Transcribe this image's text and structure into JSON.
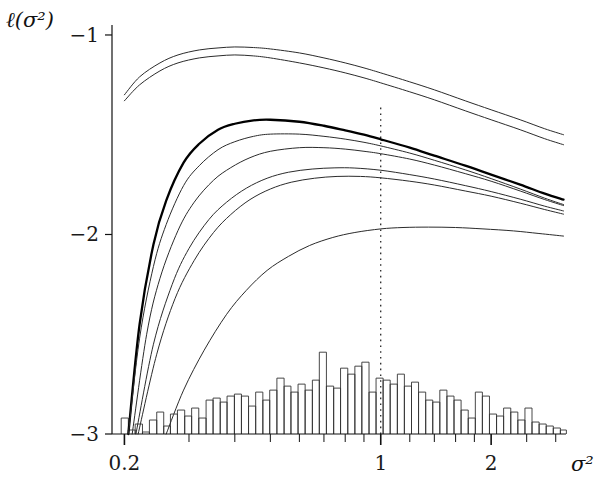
{
  "chart_data": {
    "type": "line",
    "title": "",
    "subtitle": "",
    "xlabel": "σ²",
    "ylabel": "ℓ(σ²)",
    "xscale": "log",
    "yscale": "linear",
    "xlim": [
      0.185,
      3.2
    ],
    "ylim": [
      -3.0,
      -0.95
    ],
    "grid": false,
    "legend": "none",
    "x_ticks_labeled": [
      {
        "value": 0.2,
        "label": "0.2"
      },
      {
        "value": 1.0,
        "label": "1"
      },
      {
        "value": 2.0,
        "label": "2"
      }
    ],
    "x_minor_ticks": [
      0.3,
      0.4,
      0.5,
      0.6,
      0.7,
      0.8,
      0.9,
      1.2,
      1.4,
      1.6,
      1.8,
      2.5,
      3.0
    ],
    "y_ticks_labeled": [
      {
        "value": -1,
        "label": "−1"
      },
      {
        "value": -2,
        "label": "−2"
      },
      {
        "value": -3,
        "label": "−3"
      }
    ],
    "annotations": [
      {
        "name": "reference-line-sigma-one",
        "type": "vline",
        "x": 1.0,
        "style": "dotted",
        "y_from": -3.0,
        "y_to": -1.35
      }
    ],
    "series": [
      {
        "name": "curve-1-upper-a",
        "style": "thin",
        "linewidth": 1.0,
        "color": "#2b2b2b",
        "x": [
          0.2,
          0.22,
          0.25,
          0.28,
          0.32,
          0.36,
          0.4,
          0.45,
          0.5,
          0.6,
          0.7,
          0.8,
          0.9,
          1.0,
          1.2,
          1.4,
          1.7,
          2.0,
          2.4,
          2.8,
          3.15
        ],
        "y": [
          -1.3,
          -1.21,
          -1.14,
          -1.1,
          -1.075,
          -1.065,
          -1.06,
          -1.063,
          -1.07,
          -1.09,
          -1.115,
          -1.14,
          -1.165,
          -1.19,
          -1.235,
          -1.275,
          -1.33,
          -1.375,
          -1.425,
          -1.47,
          -1.5
        ]
      },
      {
        "name": "curve-2-upper-b",
        "style": "thin",
        "linewidth": 1.0,
        "color": "#2b2b2b",
        "x": [
          0.2,
          0.22,
          0.25,
          0.28,
          0.32,
          0.36,
          0.4,
          0.45,
          0.5,
          0.6,
          0.7,
          0.8,
          0.9,
          1.0,
          1.2,
          1.4,
          1.7,
          2.0,
          2.4,
          2.8,
          3.15
        ],
        "y": [
          -1.33,
          -1.25,
          -1.18,
          -1.14,
          -1.115,
          -1.105,
          -1.1,
          -1.105,
          -1.115,
          -1.14,
          -1.165,
          -1.19,
          -1.215,
          -1.24,
          -1.285,
          -1.325,
          -1.38,
          -1.425,
          -1.475,
          -1.52,
          -1.55
        ]
      },
      {
        "name": "curve-3-bold",
        "style": "bold",
        "linewidth": 2.3,
        "color": "#000000",
        "x": [
          0.205,
          0.22,
          0.24,
          0.26,
          0.29,
          0.32,
          0.36,
          0.4,
          0.45,
          0.5,
          0.6,
          0.7,
          0.8,
          0.9,
          1.0,
          1.2,
          1.4,
          1.7,
          2.0,
          2.4,
          2.8,
          3.15
        ],
        "y": [
          -3.0,
          -2.45,
          -2.05,
          -1.83,
          -1.64,
          -1.545,
          -1.475,
          -1.445,
          -1.428,
          -1.425,
          -1.435,
          -1.455,
          -1.478,
          -1.5,
          -1.523,
          -1.565,
          -1.605,
          -1.655,
          -1.7,
          -1.75,
          -1.795,
          -1.825
        ]
      },
      {
        "name": "curve-4-thin-a",
        "style": "thin",
        "linewidth": 1.0,
        "color": "#2b2b2b",
        "x": [
          0.205,
          0.22,
          0.24,
          0.26,
          0.29,
          0.32,
          0.36,
          0.4,
          0.45,
          0.5,
          0.6,
          0.7,
          0.8,
          0.9,
          1.0,
          1.2,
          1.4,
          1.7,
          2.0,
          2.4,
          2.8,
          3.15
        ],
        "y": [
          -3.0,
          -2.52,
          -2.16,
          -1.95,
          -1.755,
          -1.655,
          -1.575,
          -1.535,
          -1.508,
          -1.497,
          -1.497,
          -1.508,
          -1.522,
          -1.538,
          -1.556,
          -1.592,
          -1.628,
          -1.676,
          -1.72,
          -1.772,
          -1.818,
          -1.85
        ]
      },
      {
        "name": "curve-5-thin-b",
        "style": "thin",
        "linewidth": 1.0,
        "color": "#2b2b2b",
        "x": [
          0.21,
          0.23,
          0.25,
          0.28,
          0.31,
          0.35,
          0.39,
          0.44,
          0.5,
          0.6,
          0.7,
          0.8,
          0.9,
          1.0,
          1.2,
          1.4,
          1.7,
          2.0,
          2.4,
          2.8,
          3.15
        ],
        "y": [
          -3.0,
          -2.5,
          -2.22,
          -1.98,
          -1.838,
          -1.728,
          -1.665,
          -1.615,
          -1.583,
          -1.565,
          -1.565,
          -1.572,
          -1.583,
          -1.595,
          -1.622,
          -1.652,
          -1.695,
          -1.733,
          -1.782,
          -1.825,
          -1.855
        ]
      },
      {
        "name": "curve-6-thin-c",
        "style": "thin",
        "linewidth": 1.0,
        "color": "#2b2b2b",
        "x": [
          0.215,
          0.24,
          0.27,
          0.3,
          0.34,
          0.38,
          0.43,
          0.49,
          0.56,
          0.65,
          0.75,
          0.85,
          1.0,
          1.2,
          1.4,
          1.7,
          2.0,
          2.4,
          2.8,
          3.15
        ],
        "y": [
          -3.0,
          -2.55,
          -2.25,
          -2.07,
          -1.925,
          -1.838,
          -1.768,
          -1.718,
          -1.688,
          -1.672,
          -1.666,
          -1.667,
          -1.678,
          -1.7,
          -1.722,
          -1.755,
          -1.785,
          -1.823,
          -1.858,
          -1.882
        ]
      },
      {
        "name": "curve-7-thin-d",
        "style": "thin",
        "linewidth": 1.0,
        "color": "#2b2b2b",
        "x": [
          0.218,
          0.245,
          0.275,
          0.31,
          0.35,
          0.39,
          0.44,
          0.5,
          0.57,
          0.66,
          0.76,
          0.88,
          1.0,
          1.2,
          1.4,
          1.7,
          2.0,
          2.4,
          2.8,
          3.15
        ],
        "y": [
          -3.0,
          -2.6,
          -2.32,
          -2.13,
          -1.99,
          -1.9,
          -1.825,
          -1.772,
          -1.738,
          -1.718,
          -1.709,
          -1.709,
          -1.716,
          -1.733,
          -1.752,
          -1.782,
          -1.808,
          -1.843,
          -1.875,
          -1.898
        ]
      },
      {
        "name": "curve-8-lowest",
        "style": "thin",
        "linewidth": 1.0,
        "color": "#2b2b2b",
        "x": [
          0.26,
          0.29,
          0.33,
          0.38,
          0.43,
          0.49,
          0.56,
          0.64,
          0.74,
          0.85,
          1.0,
          1.15,
          1.35,
          1.6,
          1.9,
          2.3,
          2.7,
          3.15
        ],
        "y": [
          -3.0,
          -2.78,
          -2.58,
          -2.4,
          -2.28,
          -2.18,
          -2.11,
          -2.055,
          -2.015,
          -1.99,
          -1.972,
          -1.965,
          -1.963,
          -1.965,
          -1.972,
          -1.982,
          -1.995,
          -2.008
        ]
      }
    ],
    "histogram": {
      "name": "sigma-squared-histogram",
      "baseline": -3.0,
      "max_bar_height": 0.62,
      "bar_edge_color": "#333333",
      "bar_fill": "none",
      "bins_x": [
        0.196,
        0.205,
        0.214,
        0.224,
        0.234,
        0.245,
        0.256,
        0.267,
        0.279,
        0.292,
        0.305,
        0.319,
        0.334,
        0.349,
        0.365,
        0.381,
        0.399,
        0.417,
        0.436,
        0.456,
        0.477,
        0.498,
        0.521,
        0.545,
        0.569,
        0.595,
        0.622,
        0.651,
        0.68,
        0.711,
        0.744,
        0.777,
        0.813,
        0.85,
        0.888,
        0.929,
        0.971,
        1.015,
        1.061,
        1.11,
        1.16,
        1.213,
        1.268,
        1.326,
        1.386,
        1.449,
        1.515,
        1.584,
        1.656,
        1.732,
        1.811,
        1.893,
        1.979,
        2.069,
        2.163,
        2.262,
        2.365,
        2.473,
        2.585,
        2.703,
        2.826,
        2.955,
        3.089
      ],
      "bar_heights": [
        0.08,
        0.02,
        0.05,
        0.01,
        0.07,
        0.11,
        0.04,
        0.1,
        0.12,
        0.09,
        0.13,
        0.08,
        0.17,
        0.18,
        0.16,
        0.19,
        0.2,
        0.19,
        0.14,
        0.21,
        0.17,
        0.22,
        0.28,
        0.24,
        0.21,
        0.25,
        0.22,
        0.27,
        0.41,
        0.24,
        0.23,
        0.33,
        0.3,
        0.34,
        0.36,
        0.21,
        0.28,
        0.27,
        0.25,
        0.3,
        0.24,
        0.26,
        0.21,
        0.17,
        0.16,
        0.22,
        0.19,
        0.17,
        0.12,
        0.08,
        0.21,
        0.19,
        0.1,
        0.09,
        0.13,
        0.11,
        0.07,
        0.13,
        0.06,
        0.05,
        0.04,
        0.03,
        0.02
      ]
    }
  }
}
